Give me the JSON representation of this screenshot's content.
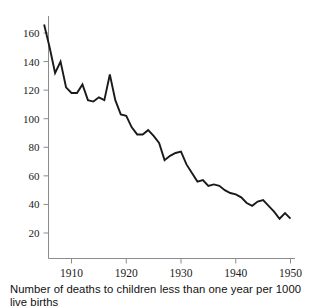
{
  "chart_data": {
    "type": "line",
    "title": "",
    "subtitle": "",
    "caption": "Number of deaths to children less than one year per 1000 live births",
    "xlabel": "",
    "ylabel": "",
    "xlim": [
      1905,
      1950
    ],
    "ylim": [
      14,
      170
    ],
    "grid": false,
    "legend": null,
    "x_tick_labels": [
      "1910",
      "1920",
      "1930",
      "1940",
      "1950"
    ],
    "x_tick_values": [
      1910,
      1920,
      1930,
      1940,
      1950
    ],
    "y_tick_labels": [
      "20",
      "40",
      "60",
      "80",
      "100",
      "120",
      "140",
      "160"
    ],
    "y_tick_values": [
      20,
      40,
      60,
      80,
      100,
      120,
      140,
      160
    ],
    "series_name": "Infant mortality rate",
    "x": [
      1905,
      1906,
      1907,
      1908,
      1909,
      1910,
      1911,
      1912,
      1913,
      1914,
      1915,
      1916,
      1917,
      1918,
      1919,
      1920,
      1921,
      1922,
      1923,
      1924,
      1925,
      1926,
      1927,
      1928,
      1929,
      1930,
      1931,
      1932,
      1933,
      1934,
      1935,
      1936,
      1937,
      1938,
      1939,
      1940,
      1941,
      1942,
      1943,
      1944,
      1945,
      1946,
      1947,
      1948,
      1949,
      1950
    ],
    "values": [
      166,
      150,
      132,
      140,
      122,
      118,
      118,
      124,
      113,
      112,
      115,
      113,
      131,
      113,
      103,
      102,
      94,
      89,
      89,
      92,
      88,
      83,
      71,
      74,
      76,
      77,
      68,
      62,
      56,
      57,
      53,
      54,
      53,
      50,
      48,
      47,
      45,
      41,
      39,
      42,
      43,
      39,
      35,
      30,
      34,
      30
    ],
    "annotations": []
  },
  "axes": {
    "y_axis_name": "y-axis",
    "x_axis_name": "x-axis"
  },
  "colors": {
    "line": "#1a1a1a",
    "axis": "#8c8c8c",
    "text": "#1a1a1a",
    "background": "#ffffff"
  }
}
